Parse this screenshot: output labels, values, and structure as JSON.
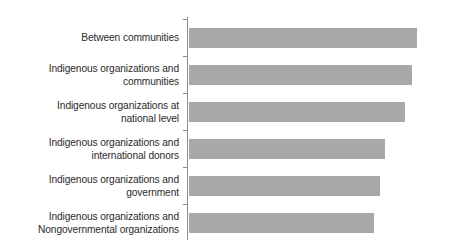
{
  "chart_data": {
    "type": "bar",
    "orientation": "horizontal",
    "title": "",
    "subtitle": "",
    "xlabel": "",
    "ylabel": "",
    "categories": [
      "Between communities",
      "Indigenous organizations and communities",
      "Indigenous organizations at national level",
      "Indigenous organizations and international donors",
      "Indigenous organizations and government",
      "Indigenous organizations and Nongovernmental organizations"
    ],
    "category_lines": [
      [
        "Between communities"
      ],
      [
        "Indigenous organizations and",
        "communities"
      ],
      [
        "Indigenous organizations at",
        "national level"
      ],
      [
        "Indigenous organizations and",
        "international donors"
      ],
      [
        "Indigenous organizations and",
        "government"
      ],
      [
        "Indigenous organizations and",
        "Nongovernmental organizations"
      ]
    ],
    "values": [
      100,
      98,
      95,
      86,
      84,
      81
    ],
    "xlim": [
      0,
      115
    ],
    "grid": false,
    "legend": false,
    "legend_position": "none",
    "tick_labels_x": [],
    "tick_labels_y": [
      "Between communities",
      "Indigenous organizations and communities",
      "Indigenous organizations at national level",
      "Indigenous organizations and international donors",
      "Indigenous organizations and government",
      "Indigenous organizations and Nongovernmental organizations"
    ],
    "annotations": []
  },
  "style": {
    "bar_color": "#a8a8a8",
    "axis_color": "#8d8d8d",
    "text_color": "#2b2b2b",
    "background": "#ffffff"
  }
}
